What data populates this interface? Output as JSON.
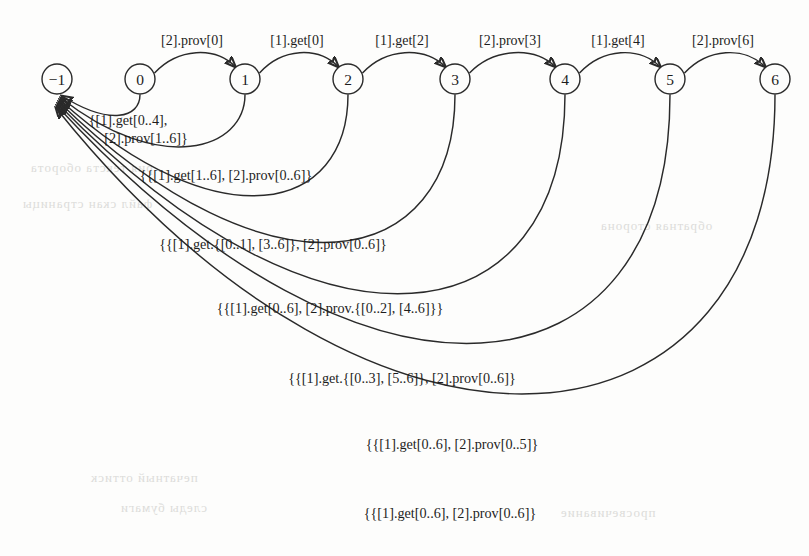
{
  "figure": {
    "kind": "state-transition-graph",
    "background_color": "#fdfdfc",
    "ink_color": "#2a2a2a"
  },
  "nodes": [
    {
      "id": "n-1",
      "label": "−1",
      "cx": 57,
      "cy": 79,
      "r": 15
    },
    {
      "id": "n0",
      "label": "0",
      "cx": 140,
      "cy": 79,
      "r": 15
    },
    {
      "id": "n1",
      "label": "1",
      "cx": 245,
      "cy": 79,
      "r": 15
    },
    {
      "id": "n2",
      "label": "2",
      "cx": 348,
      "cy": 79,
      "r": 15
    },
    {
      "id": "n3",
      "label": "3",
      "cx": 455,
      "cy": 79,
      "r": 15
    },
    {
      "id": "n4",
      "label": "4",
      "cx": 565,
      "cy": 79,
      "r": 15
    },
    {
      "id": "n5",
      "label": "5",
      "cx": 670,
      "cy": 79,
      "r": 15
    },
    {
      "id": "n6",
      "label": "6",
      "cx": 775,
      "cy": 79,
      "r": 15
    }
  ],
  "forward_edges": [
    {
      "from": "n0",
      "to": "n1",
      "label": "[2].prov[0]",
      "label_x": 192,
      "label_y": 45,
      "d": "M 154.5,73 C 178,48 215,46 235.5,67"
    },
    {
      "from": "n1",
      "to": "n2",
      "label": "[1].get[0]",
      "label_x": 297,
      "label_y": 45,
      "d": "M 259.5,73 C 282,48 318,46 338.5,67"
    },
    {
      "from": "n2",
      "to": "n3",
      "label": "[1].get[2]",
      "label_x": 402,
      "label_y": 45,
      "d": "M 362.5,73 C 386,48 424,46 445.5,67"
    },
    {
      "from": "n3",
      "to": "n4",
      "label": "[2].prov[3]",
      "label_x": 510,
      "label_y": 45,
      "d": "M 469.5,73 C 494,48 534,46 555.5,67"
    },
    {
      "from": "n4",
      "to": "n5",
      "label": "[1].get[4]",
      "label_x": 618,
      "label_y": 45,
      "d": "M 579.5,73 C 603,48 639,46 660.5,67"
    },
    {
      "from": "n5",
      "to": "n6",
      "label": "[2].prov[6]",
      "label_x": 723,
      "label_y": 45,
      "d": "M 684.5,73 C 708,48 744,46 765.5,67"
    }
  ],
  "return_arcs": [
    {
      "from": "n0",
      "to": "n-1",
      "label": "{[1].get[0..4],",
      "label2": "[2].prov[1..6]}",
      "label_x": 128,
      "label_y": 125,
      "d": "M 140,94.5 C 140,118 110,126 62,96"
    },
    {
      "from": "n1",
      "to": "n-1",
      "label": "{{[1].get[1..6], [2].prov[0..6]}",
      "label_x": 226,
      "label_y": 180,
      "d": "M 245,94.5 C 245,150 160,176 61,98"
    },
    {
      "from": "n2",
      "to": "n-1",
      "label": "{{[1].get.{[0..1], [3..6]}, [2].prov[0..6]}",
      "label_x": 273,
      "label_y": 249,
      "d": "M 348,94.5 C 348,212 220,244 60,100"
    },
    {
      "from": "n3",
      "to": "n-1",
      "label": "{{[1].get[0..6], [2].prov.{[0..2], [4..6]}}",
      "label_x": 330,
      "label_y": 313,
      "d": "M 455,94.5 C 455,272 270,308 59,102"
    },
    {
      "from": "n4",
      "to": "n-1",
      "label": "{{[1].get.{[0..3], [5..6]}, [2].prov[0..6]}",
      "label_x": 402,
      "label_y": 383,
      "d": "M 565,94.5 C 565,338 325,378 58,104"
    },
    {
      "from": "n5",
      "to": "n-1",
      "label": "{{[1].get[0..6], [2].prov[0..5]}",
      "label_x": 452,
      "label_y": 449,
      "d": "M 670,94.5 C 670,404 370,444 57,106"
    },
    {
      "from": "n6",
      "to": "n-1",
      "label": "{{[1].get[0..6], [2].prov[0..6]}",
      "label_x": 450,
      "label_y": 518,
      "d": "M 775,94.5 C 775,470 380,512 56,108"
    }
  ],
  "bleed_text": [
    {
      "text": "рия текста оборота",
      "x": 30,
      "y": 160
    },
    {
      "text": "файл скан страницы",
      "x": 22,
      "y": 196
    },
    {
      "text": "обратная сторона",
      "x": 600,
      "y": 218
    },
    {
      "text": "печатный оттиск",
      "x": 90,
      "y": 470
    },
    {
      "text": "следы бумаги",
      "x": 120,
      "y": 500
    },
    {
      "text": "просвечивание",
      "x": 560,
      "y": 505
    }
  ]
}
